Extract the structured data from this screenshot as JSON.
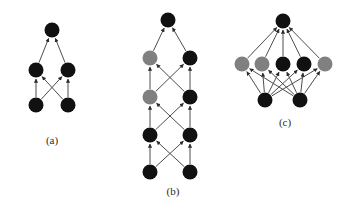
{
  "figure": {
    "width": 347,
    "height": 210,
    "background": "#ffffff",
    "colors": {
      "node_black": "#111111",
      "node_gray": "#808080",
      "edge": "#4d4d4d",
      "edge_light": "#8c8c8c",
      "caption": "#2b2b2b"
    },
    "node_radius": 7.5,
    "panels": [
      {
        "id": "a",
        "caption": "(a)",
        "caption_x": 52,
        "caption_y": 141,
        "nodes": [
          {
            "id": "a-t1",
            "x": 52,
            "y": 30,
            "color": "node_black",
            "layer": 0,
            "index": 0
          },
          {
            "id": "a-m1",
            "x": 36,
            "y": 70,
            "color": "node_black",
            "layer": 1,
            "index": 0
          },
          {
            "id": "a-m2",
            "x": 68,
            "y": 70,
            "color": "node_black",
            "layer": 1,
            "index": 1
          },
          {
            "id": "a-b1",
            "x": 36,
            "y": 105,
            "color": "node_black",
            "layer": 2,
            "index": 0
          },
          {
            "id": "a-b2",
            "x": 68,
            "y": 105,
            "color": "node_black",
            "layer": 2,
            "index": 1
          }
        ],
        "edges": [
          {
            "from": "a-m1",
            "to": "a-t1"
          },
          {
            "from": "a-m2",
            "to": "a-t1"
          },
          {
            "from": "a-b1",
            "to": "a-m1"
          },
          {
            "from": "a-b2",
            "to": "a-m2"
          },
          {
            "from": "a-b1",
            "to": "a-m2"
          },
          {
            "from": "a-b2",
            "to": "a-m1"
          }
        ]
      },
      {
        "id": "b",
        "caption": "(b)",
        "caption_x": 173,
        "caption_y": 192,
        "nodes": [
          {
            "id": "b-t1",
            "x": 168,
            "y": 20,
            "color": "node_black",
            "layer": 0,
            "index": 0
          },
          {
            "id": "b-l1a",
            "x": 150,
            "y": 58,
            "color": "node_gray",
            "layer": 1,
            "index": 0
          },
          {
            "id": "b-l1b",
            "x": 190,
            "y": 58,
            "color": "node_black",
            "layer": 1,
            "index": 1
          },
          {
            "id": "b-l2a",
            "x": 150,
            "y": 97,
            "color": "node_gray",
            "layer": 2,
            "index": 0
          },
          {
            "id": "b-l2b",
            "x": 190,
            "y": 97,
            "color": "node_black",
            "layer": 2,
            "index": 1
          },
          {
            "id": "b-l3a",
            "x": 150,
            "y": 135,
            "color": "node_black",
            "layer": 3,
            "index": 0
          },
          {
            "id": "b-l3b",
            "x": 190,
            "y": 135,
            "color": "node_black",
            "layer": 3,
            "index": 1
          },
          {
            "id": "b-l4a",
            "x": 150,
            "y": 172,
            "color": "node_black",
            "layer": 4,
            "index": 0
          },
          {
            "id": "b-l4b",
            "x": 190,
            "y": 172,
            "color": "node_black",
            "layer": 4,
            "index": 1
          }
        ],
        "edges": [
          {
            "from": "b-l1a",
            "to": "b-t1"
          },
          {
            "from": "b-l1b",
            "to": "b-t1"
          },
          {
            "from": "b-l2a",
            "to": "b-l1a"
          },
          {
            "from": "b-l2b",
            "to": "b-l1b"
          },
          {
            "from": "b-l2a",
            "to": "b-l1b"
          },
          {
            "from": "b-l2b",
            "to": "b-l1a"
          },
          {
            "from": "b-l3a",
            "to": "b-l2a"
          },
          {
            "from": "b-l3b",
            "to": "b-l2b"
          },
          {
            "from": "b-l3a",
            "to": "b-l2b"
          },
          {
            "from": "b-l3b",
            "to": "b-l2a"
          },
          {
            "from": "b-l4a",
            "to": "b-l3a"
          },
          {
            "from": "b-l4b",
            "to": "b-l3b"
          },
          {
            "from": "b-l4a",
            "to": "b-l3b"
          },
          {
            "from": "b-l4b",
            "to": "b-l3a"
          }
        ]
      },
      {
        "id": "c",
        "caption": "(c)",
        "caption_x": 285,
        "caption_y": 123,
        "nodes": [
          {
            "id": "c-t1",
            "x": 283,
            "y": 21,
            "color": "node_black",
            "layer": 0,
            "index": 0
          },
          {
            "id": "c-m1",
            "x": 242,
            "y": 64,
            "color": "node_gray",
            "layer": 1,
            "index": 0
          },
          {
            "id": "c-m2",
            "x": 262,
            "y": 64,
            "color": "node_gray",
            "layer": 1,
            "index": 1
          },
          {
            "id": "c-m3",
            "x": 283,
            "y": 64,
            "color": "node_black",
            "layer": 1,
            "index": 2
          },
          {
            "id": "c-m4",
            "x": 304,
            "y": 64,
            "color": "node_black",
            "layer": 1,
            "index": 3
          },
          {
            "id": "c-m5",
            "x": 325,
            "y": 64,
            "color": "node_gray",
            "layer": 1,
            "index": 4
          },
          {
            "id": "c-b1",
            "x": 265,
            "y": 100,
            "color": "node_black",
            "layer": 2,
            "index": 0
          },
          {
            "id": "c-b2",
            "x": 300,
            "y": 100,
            "color": "node_black",
            "layer": 2,
            "index": 1
          }
        ],
        "edges": [
          {
            "from": "c-m1",
            "to": "c-t1"
          },
          {
            "from": "c-m2",
            "to": "c-t1"
          },
          {
            "from": "c-m3",
            "to": "c-t1"
          },
          {
            "from": "c-m4",
            "to": "c-t1"
          },
          {
            "from": "c-m5",
            "to": "c-t1"
          },
          {
            "from": "c-b1",
            "to": "c-m1"
          },
          {
            "from": "c-b1",
            "to": "c-m2"
          },
          {
            "from": "c-b1",
            "to": "c-m3"
          },
          {
            "from": "c-b1",
            "to": "c-m4"
          },
          {
            "from": "c-b1",
            "to": "c-m5"
          },
          {
            "from": "c-b2",
            "to": "c-m1"
          },
          {
            "from": "c-b2",
            "to": "c-m2"
          },
          {
            "from": "c-b2",
            "to": "c-m3"
          },
          {
            "from": "c-b2",
            "to": "c-m4"
          },
          {
            "from": "c-b2",
            "to": "c-m5"
          }
        ]
      }
    ]
  }
}
